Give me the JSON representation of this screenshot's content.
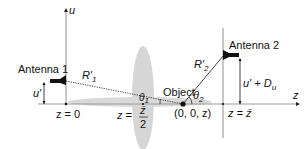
{
  "diagram": {
    "axes": {
      "u_label": "u",
      "z_label": "z"
    },
    "antennas": [
      {
        "label": "Antenna 1"
      },
      {
        "label": "Antenna 2"
      }
    ],
    "distances": {
      "r1_base": "R",
      "r1_prime": "′",
      "r1_sub": "1",
      "r2_base": "R",
      "r2_prime": "′",
      "r2_sub": "2"
    },
    "heights": {
      "u_prime": "u′",
      "u_prime_plus_du_base": "u′ + D",
      "u_prime_plus_du_sub": "u"
    },
    "angles": {
      "theta1_base": "θ",
      "theta1_sub": "1",
      "theta2_base": "θ",
      "theta2_sub": "2"
    },
    "object": {
      "label": "Object",
      "coords": "(0, 0, z)"
    },
    "positions": {
      "z0": "z = 0",
      "zhalf_lhs": "z =",
      "zhalf_num": "z̄",
      "zhalf_den": "2",
      "zbar": "z = z̄"
    },
    "colors": {
      "axis": "#b5b5b5",
      "ellipse": "#d4d4d4",
      "ink": "#111111"
    }
  }
}
